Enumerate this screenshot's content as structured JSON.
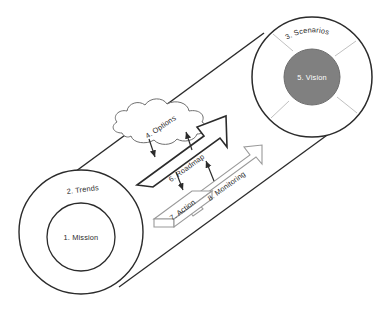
{
  "diagram": {
    "background_color": "#ffffff",
    "line_color": "#2b2b2b",
    "light_line_color": "#b9b9b9",
    "vision_fill": "#808080",
    "circle_fill": "#ffffff",
    "shapes": {
      "tube": {
        "name": "tube-body",
        "description": "diagonal cylinder connecting trends circle to scenarios circle"
      },
      "mission_circle": {
        "label": "1. Mission"
      },
      "trends_ring": {
        "label": "2. Trends"
      },
      "scenarios_ring": {
        "label": "3. Scenarios"
      },
      "options_cloud": {
        "label": "4. Options"
      },
      "vision_circle": {
        "label": "5. Vision"
      },
      "roadmap_arrow": {
        "label": "6. Roadmap"
      },
      "action_box": {
        "label": "7. Action"
      },
      "monitoring_arrow": {
        "label": "8. Monitoring"
      }
    },
    "labels": [
      "1. Mission",
      "2. Trends",
      "3. Scenarios",
      "4. Options",
      "5. Vision",
      "6. Roadmap",
      "7. Action",
      "8. Monitoring"
    ]
  }
}
